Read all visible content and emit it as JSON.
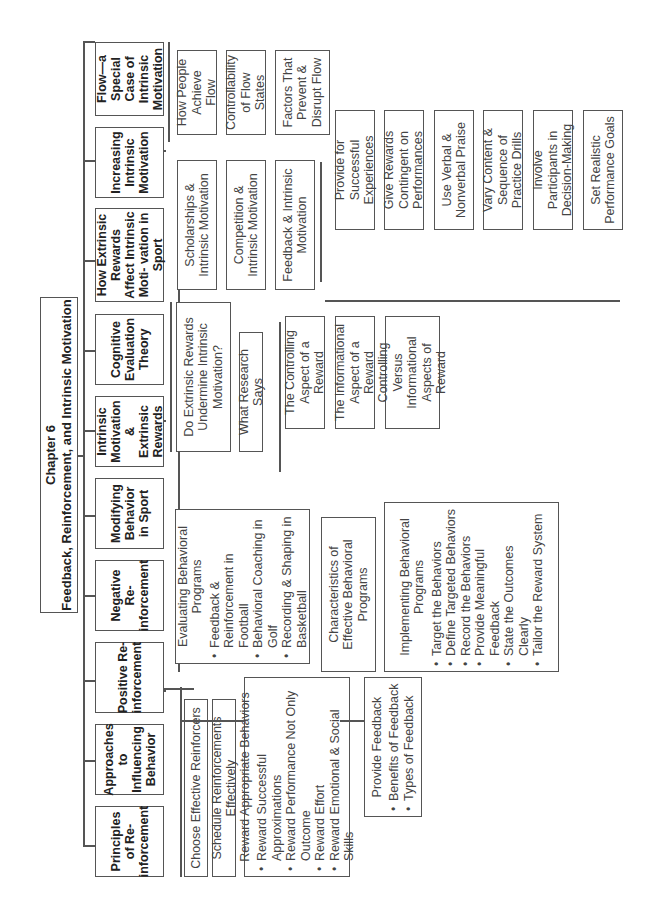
{
  "title": {
    "line1": "Chapter 6",
    "line2": "Feedback, Reinforcement, and Intrinsic Motivation"
  },
  "main_topics": [
    {
      "label": "Principles of Re- inforcement"
    },
    {
      "label": "Approaches to Influencing Behavior"
    },
    {
      "label": "Positive Re- inforcement"
    },
    {
      "label": "Negative Re- inforcement"
    },
    {
      "label": "Modifying Behavior in Sport"
    },
    {
      "label": "Intrinsic Motivation & Extrinsic Rewards"
    },
    {
      "label": "Cognitive Evaluation Theory"
    },
    {
      "label": "How Extrinsic Rewards Affect Intrinsic Moti- vation in Sport"
    },
    {
      "label": "Increasing Intrinsic Motivation"
    },
    {
      "label": "Flow—a Special Case of Intrinsic Motivation"
    }
  ],
  "positive_reinforcement": {
    "choose": "Choose Effective Reinforcers",
    "schedule": "Schedule Reinforcements Effectively",
    "reward": {
      "head": "Reward Appropriate Behaviors",
      "items": [
        "Reward Successful Approximations",
        "Reward Performance Not Only Outcome",
        "Reward Effort",
        "Reward Emotional & Social Skills"
      ]
    },
    "feedback": {
      "head": "Provide Feedback",
      "items": [
        "Benefits of Feedback",
        "Types of Feedback"
      ]
    }
  },
  "modifying_behavior": {
    "evaluating": {
      "head": "Evaluating Behavioral Programs",
      "items": [
        "Feedback & Reinforcement in Football",
        "Behavioral Coaching in Golf",
        "Recording & Shaping in Basketball"
      ]
    },
    "characteristics": "Characteristics of Effective Behavioral Programs",
    "implementing": {
      "head": "Implementing Behavioral Programs",
      "items": [
        "Target the Behaviors",
        "Define Targeted Behaviors",
        "Record the Behaviors",
        "Provide Meaningful Feedback",
        "State the Outcomes Clearly",
        "Tailor the Reward System"
      ]
    }
  },
  "intrinsic_extrinsic": {
    "undermine": "Do Extrinsic Rewards Undermine Intrinsic Motivation?",
    "research": "What Research Says"
  },
  "cognitive_evaluation": {
    "controlling": "The Controlling Aspect of a Reward",
    "informational": "The Informational Aspect of a Reward",
    "versus": "Controlling Versus Informational Aspects of Reward"
  },
  "extrinsic_affect": {
    "scholarships": "Scholarships & Intrinsic Motivation",
    "competition": "Competition & Intrinsic Motivation",
    "feedback": "Feedback & Intrinsic Motivation"
  },
  "increasing": {
    "items": [
      "Provide for Successful Experiences",
      "Give Rewards Contingent on Performances",
      "Use Verbal & Nonverbal Praise",
      "Vary Content & Sequence of Practice Drills",
      "Involve Participants in Decision-Making",
      "Set Realistic Performance Goals"
    ]
  },
  "flow": {
    "items": [
      "How People Achieve Flow",
      "Controllability of Flow States",
      "Factors That Prevent & Disrupt Flow"
    ]
  }
}
